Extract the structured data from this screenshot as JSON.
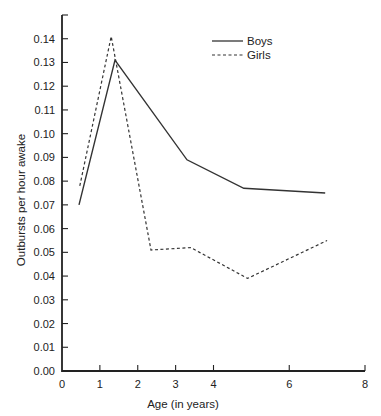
{
  "chart_data": {
    "type": "line",
    "title": "",
    "xlabel": "Age (in years)",
    "ylabel": "Outbursts per hour awake",
    "xlim": [
      0,
      8
    ],
    "ylim": [
      0,
      0.15
    ],
    "x_ticks": [
      0,
      1,
      2,
      3,
      4,
      6,
      8
    ],
    "x_tick_labels": [
      "0",
      "1",
      "2",
      "3",
      "4",
      "6",
      "8"
    ],
    "y_ticks": [
      0,
      0.01,
      0.02,
      0.03,
      0.04,
      0.05,
      0.06,
      0.07,
      0.08,
      0.09,
      0.1,
      0.11,
      0.12,
      0.13,
      0.14,
      0.15
    ],
    "y_tick_labels": [
      "0.00",
      "0.01",
      "0.02",
      "0.03",
      "0.04",
      "0.05",
      "0.06",
      "0.07",
      "0.08",
      "0.09",
      "0.10",
      "0.11",
      "0.12",
      "0.13",
      "0.14",
      ""
    ],
    "grid": false,
    "legend_position": "top-right",
    "series": [
      {
        "name": "Boys",
        "style": "solid",
        "color": "#333333",
        "x": [
          0.45,
          1.4,
          3.3,
          4.8,
          6.95
        ],
        "y": [
          0.07,
          0.131,
          0.089,
          0.077,
          0.075
        ]
      },
      {
        "name": "Girls",
        "style": "dashed",
        "color": "#333333",
        "x": [
          0.47,
          1.3,
          2.35,
          3.4,
          4.9,
          7.0
        ],
        "y": [
          0.078,
          0.141,
          0.051,
          0.052,
          0.039,
          0.055
        ]
      }
    ]
  }
}
